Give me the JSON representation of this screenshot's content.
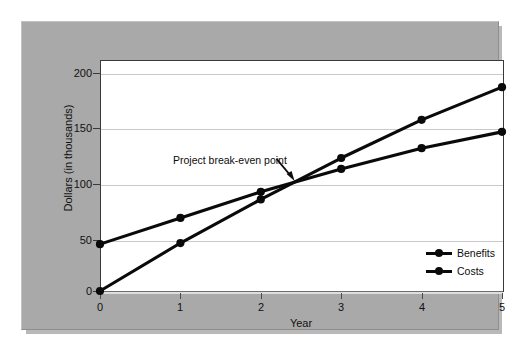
{
  "chart_data": {
    "type": "line",
    "title": "",
    "xlabel": "Year",
    "ylabel": "Dollars (in thousands)",
    "x": [
      0,
      1,
      2,
      3,
      4,
      5
    ],
    "xtick_labels": [
      "0",
      "1",
      "2",
      "3",
      "4",
      "5"
    ],
    "ytick_labels": [
      "0",
      "50",
      "100",
      "150",
      "200"
    ],
    "yticks": [
      0,
      50,
      100,
      150,
      200
    ],
    "xlim": [
      0,
      5
    ],
    "ylim": [
      0,
      212
    ],
    "grid": "horizontal",
    "legend_position": "lower-right",
    "series": [
      {
        "name": "Benefits",
        "color": "#0a0a0a",
        "marker": "circle",
        "values": [
          0,
          44,
          84,
          122,
          157,
          187
        ]
      },
      {
        "name": "Costs",
        "color": "#0a0a0a",
        "marker": "circle",
        "values": [
          43,
          67,
          91,
          112,
          131,
          146
        ]
      }
    ],
    "annotations": [
      {
        "text": "Project break-even point",
        "target_x": 2.42,
        "target_y": 101,
        "arrow": true
      }
    ]
  },
  "axis": {
    "x_title": "Year",
    "y_title": "Dollars (in thousands)"
  },
  "legend": {
    "items": [
      {
        "label": "Benefits"
      },
      {
        "label": "Costs"
      }
    ]
  },
  "annotation": {
    "text": "Project break-even point"
  },
  "colors": {
    "panel": "#a9a9a9",
    "plot_background": "#ffffff",
    "line": "#0a0a0a",
    "gridline": "#c9c9c9",
    "text": "#111111"
  }
}
